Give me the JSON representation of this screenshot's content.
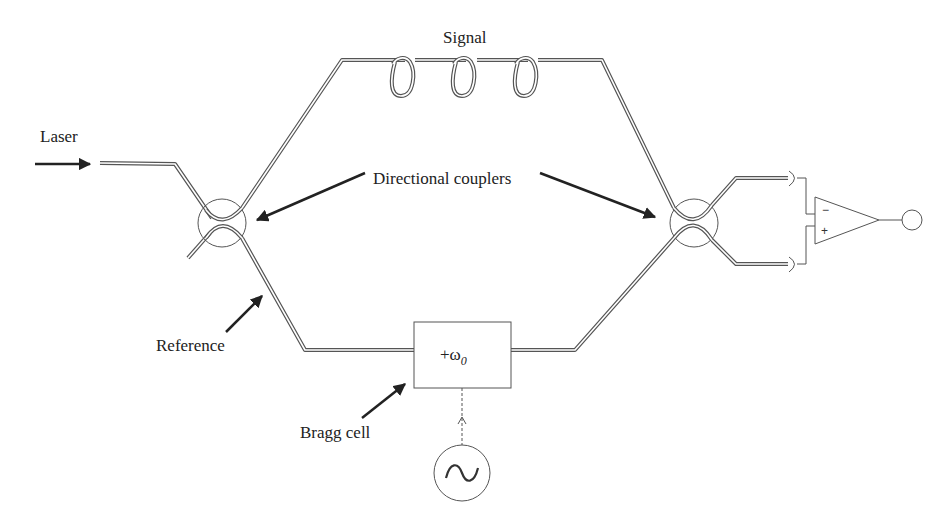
{
  "diagram": {
    "labels": {
      "signal": "Signal",
      "laser": "Laser",
      "couplers": "Directional couplers",
      "reference": "Reference",
      "bragg": "Bragg cell",
      "bragg_box": "+ω",
      "bragg_sub": "0",
      "amp_minus": "−",
      "amp_plus": "+"
    },
    "components": [
      {
        "id": "laser-input",
        "type": "source-arrow"
      },
      {
        "id": "coupler-left",
        "type": "directional-coupler"
      },
      {
        "id": "signal-arm",
        "type": "fiber",
        "coils": 3
      },
      {
        "id": "reference-arm",
        "type": "fiber"
      },
      {
        "id": "bragg-cell",
        "type": "frequency-shifter"
      },
      {
        "id": "oscillator",
        "type": "ac-source"
      },
      {
        "id": "coupler-right",
        "type": "directional-coupler"
      },
      {
        "id": "photodetector-top",
        "type": "photodetector"
      },
      {
        "id": "photodetector-bottom",
        "type": "photodetector"
      },
      {
        "id": "diff-amplifier",
        "type": "differential-amplifier"
      },
      {
        "id": "output-terminal",
        "type": "terminal"
      }
    ],
    "colors": {
      "line": "#555555",
      "text": "#222222",
      "background": "#ffffff"
    }
  }
}
